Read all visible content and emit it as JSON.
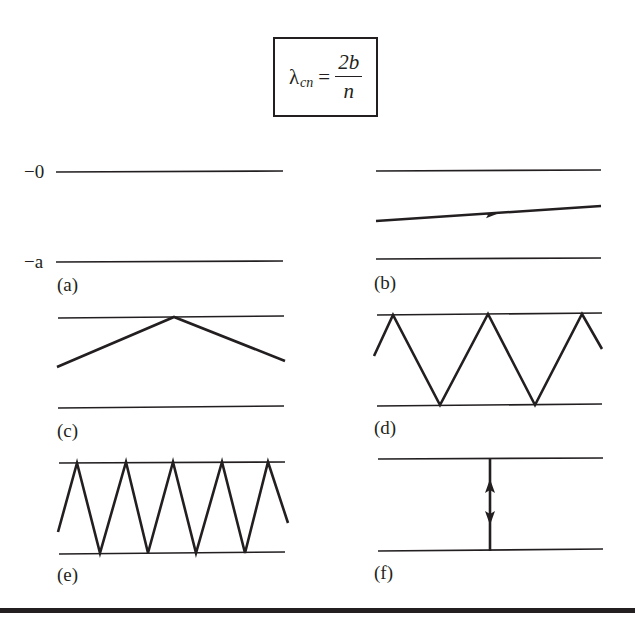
{
  "formula": {
    "lambda": "λ",
    "subscript": "cn",
    "equals": "=",
    "numerator": "2b",
    "denominator": "n"
  },
  "axis_labels": {
    "top": "−0",
    "bottom": "−a"
  },
  "panels": [
    {
      "id": "a",
      "label": "(a)",
      "description": "empty waveguide between walls at 0 and -a"
    },
    {
      "id": "b",
      "label": "(b)",
      "description": "single ray nearly parallel to walls with forward arrow"
    },
    {
      "id": "c",
      "label": "(c)",
      "description": "shallow ray reflecting once off top wall"
    },
    {
      "id": "d",
      "label": "(d)",
      "description": "zigzag ray with moderate angle, multiple reflections"
    },
    {
      "id": "e",
      "label": "(e)",
      "description": "steep zigzag ray with many reflections"
    },
    {
      "id": "f",
      "label": "(f)",
      "description": "ray perpendicular to walls, bouncing up and down (cutoff)"
    }
  ],
  "colors": {
    "ink": "#231f20",
    "background": "#ffffff"
  }
}
